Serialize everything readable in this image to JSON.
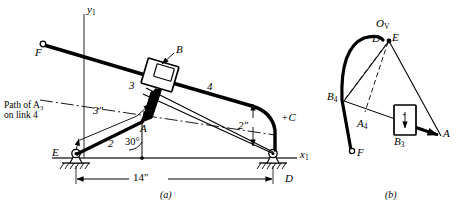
{
  "figure": {
    "title_a": "(a)",
    "title_b": "(b)",
    "dimensions": {
      "base_length": "14″",
      "link3_length": "3″",
      "offset": "2″",
      "crank_angle": "30°"
    }
  },
  "mechanism": {
    "caption_path_line1": "Path of A",
    "caption_path_sub": "3",
    "caption_path_line2": "on link 4",
    "axis_x_label": "x",
    "axis_x_sub": "1",
    "axis_y_label": "y",
    "axis_y_sub": "1",
    "points": {
      "E": "E",
      "A": "A",
      "B": "B",
      "C": "+C",
      "D": "D",
      "F": "F"
    },
    "links": {
      "link2": "2",
      "link3": "3",
      "link4": "4"
    }
  },
  "velocity_polygon": {
    "pole_label": "O",
    "pole_sub": "V",
    "points": {
      "D": "D",
      "E": "E",
      "A": "A",
      "F": "F",
      "B4": "B",
      "B4_sub": "4",
      "A4": "A",
      "A4_sub": "4",
      "B3": "B",
      "B3_sub": "3"
    }
  },
  "colors": {
    "ink": "#000000",
    "thin_line": "#3a3a3a",
    "background": "#ffffff"
  }
}
